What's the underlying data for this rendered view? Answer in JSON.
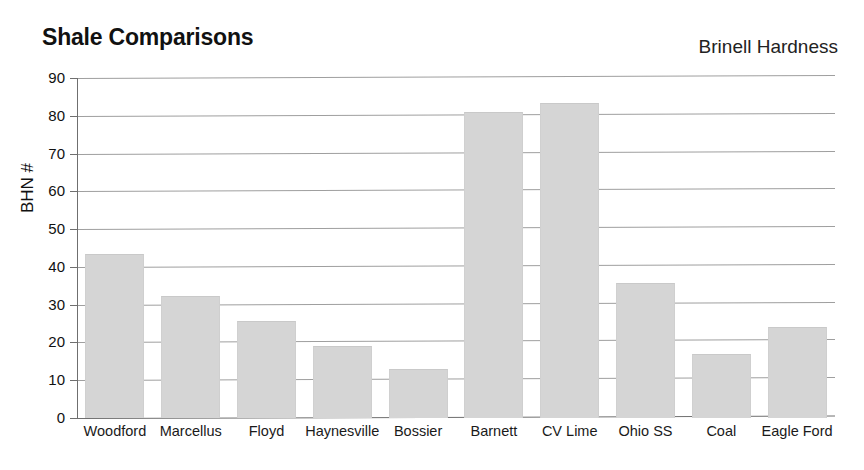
{
  "chart_data": {
    "type": "bar",
    "title": "Shale Comparisons",
    "subtitle": "Brinell Hardness",
    "xlabel": "",
    "ylabel": "BHN #",
    "ylim": [
      0,
      90
    ],
    "ytick_step": 10,
    "yticks": [
      90,
      80,
      70,
      60,
      50,
      40,
      30,
      20,
      10,
      0
    ],
    "grid": true,
    "legend": "none",
    "bar_color": "#d5d5d5",
    "categories": [
      "Woodford",
      "Marcellus",
      "Floyd",
      "Haynesville",
      "Bossier",
      "Barnett",
      "CV Lime",
      "Ohio SS",
      "Coal",
      "Eagle Ford"
    ],
    "values": [
      43.4,
      32.3,
      25.6,
      19.0,
      13.0,
      81.0,
      83.4,
      35.7,
      17.0,
      24.2
    ]
  },
  "axis": {
    "y_title": "BHN #"
  }
}
